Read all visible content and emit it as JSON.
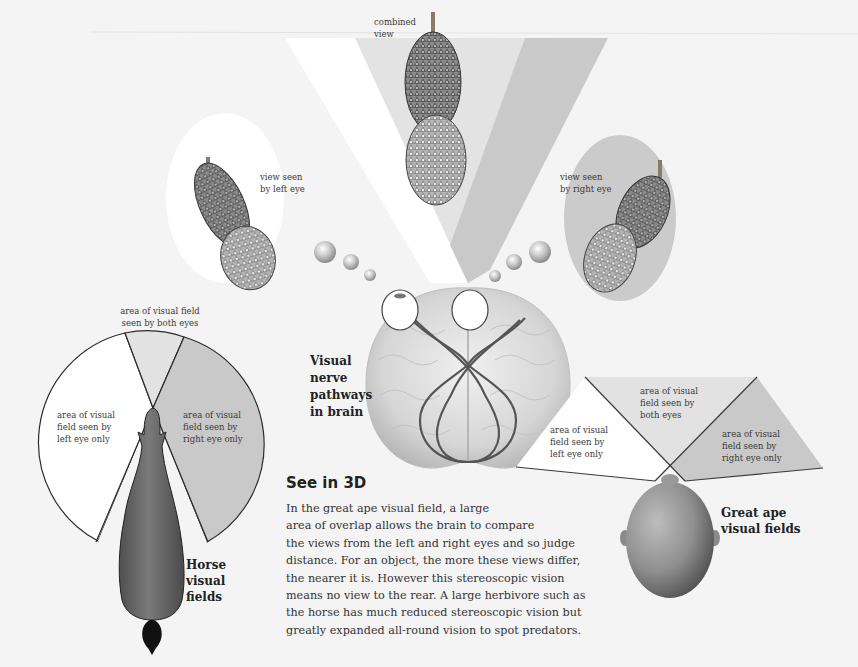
{
  "combined_view": {
    "label": "combined\nview"
  },
  "left_eye_view": {
    "label": "view seen\nby left eye"
  },
  "right_eye_view": {
    "label": "view seen\nby right eye"
  },
  "brain": {
    "label": "Visual\nnerve\npathways\nin brain"
  },
  "horse": {
    "title": "Horse\nvisual\nfields",
    "both_eyes": "area of visual field\nseen by both eyes",
    "left_eye": "area of visual\nfield seen by\nleft eye only",
    "right_eye": "area of visual\nfield seen by\nright eye only"
  },
  "ape": {
    "title": "Great ape\nvisual fields",
    "both_eyes": "area of visual\nfield seen by\nboth eyes",
    "left_eye": "area of visual\nfield seen by\nleft eye only",
    "right_eye": "area of visual\nfield seen by\nright eye only"
  },
  "article": {
    "heading": "See in 3D",
    "lines": [
      "In the great ape visual field, a large",
      "area of overlap allows the brain to compare",
      "the views from the left and right eyes and so judge",
      "distance. For an object, the more these views differ,",
      "the nearer it is. However this stereoscopic vision",
      "means no view to the rear. A large herbivore such as",
      "the horse has much reduced stereoscopic vision but",
      "greatly expanded all-round vision to spot predators."
    ]
  },
  "colors": {
    "background": "#f4f4f4",
    "left_field": "#ffffff",
    "both_field": "#e2e2e2",
    "right_field": "#c9c9c9",
    "outline": "#2a2a2a",
    "horse_body": "#6e6e6e",
    "nerve": "#555555"
  }
}
